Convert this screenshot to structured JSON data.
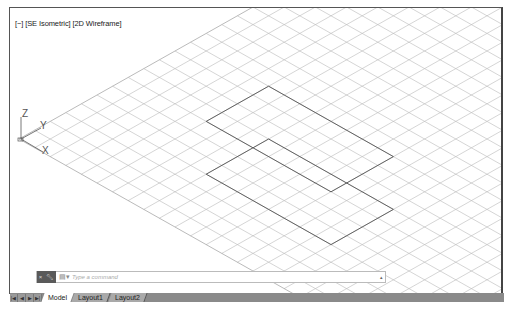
{
  "viewport": {
    "controls_label": "[−]",
    "view_label": "[SE Isometric]",
    "visual_style_label": "[2D Wireframe]",
    "ucs_icon": {
      "z_label": "Z",
      "y_label": "Y",
      "x_label": "X"
    },
    "grid": {
      "origin": [
        18,
        138
      ],
      "cell_u": [
        15.6,
        8.8
      ],
      "cell_v": [
        15.6,
        -8.8
      ],
      "line_color": "#b8b8b8",
      "edge_color": "#8c8c8c"
    },
    "objects": [
      {
        "type": "rectangle",
        "corners_ab": [
          [
            5,
            7
          ],
          [
            5,
            11
          ],
          [
            13,
            11
          ],
          [
            13,
            7
          ]
        ],
        "color": "#555555"
      },
      {
        "type": "rectangle",
        "corners_ab": [
          [
            8,
            4
          ],
          [
            8,
            8
          ],
          [
            16,
            8
          ],
          [
            16,
            4
          ]
        ],
        "color": "#555555"
      }
    ]
  },
  "command_line": {
    "placeholder": "Type a command",
    "close_icon": "×",
    "customize_icon": "wrench-icon",
    "prompt_icon": "▤▾",
    "dropdown_icon": "▴"
  },
  "layout_tabs": {
    "nav_buttons": [
      "|◀",
      "◀",
      "▶",
      "▶|"
    ],
    "tabs": [
      {
        "label": "Model",
        "active": true
      },
      {
        "label": "Layout1",
        "active": false
      },
      {
        "label": "Layout2",
        "active": false
      }
    ]
  }
}
